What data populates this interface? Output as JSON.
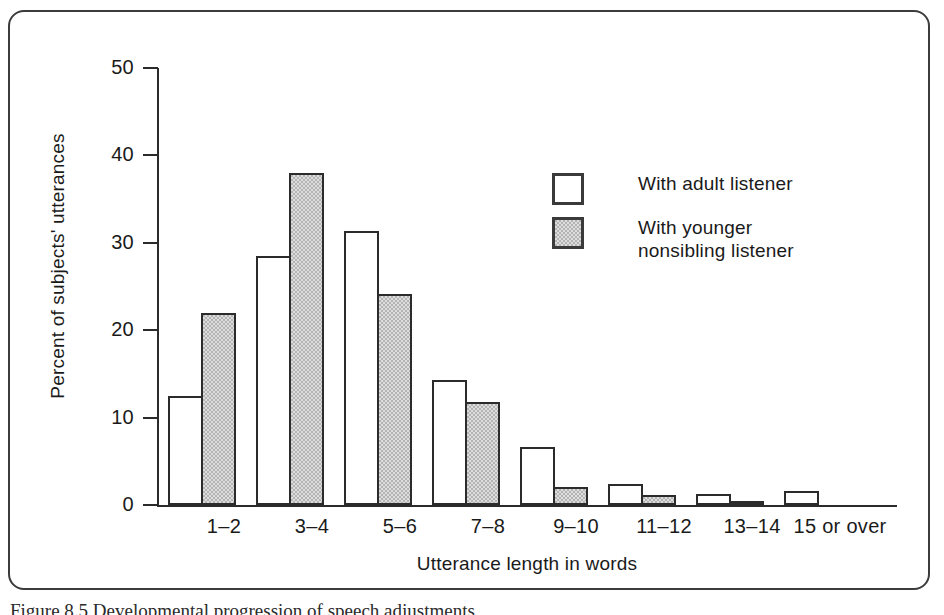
{
  "figure": {
    "caption": "Figure 8.5   Developmental progression of speech adjustments"
  },
  "legend": {
    "position": "inside-top-right",
    "items": [
      {
        "label": "With adult listener",
        "swatch": "white-square-icon",
        "color": "#ffffff"
      },
      {
        "label": "With younger\nnonsibling listener",
        "swatch": "gray-square-icon",
        "color": "#b4b4b4"
      }
    ]
  },
  "chart_data": {
    "type": "bar",
    "title": "",
    "xlabel": "Utterance length in words",
    "ylabel": "Percent of subjects' utterances",
    "categories": [
      "1–2",
      "3–4",
      "5–6",
      "7–8",
      "9–10",
      "11–12",
      "13–14",
      "15 or over"
    ],
    "series": [
      {
        "name": "With adult listener",
        "values": [
          12.5,
          28.5,
          31.3,
          14.3,
          6.6,
          2.4,
          1.3,
          1.6
        ]
      },
      {
        "name": "With younger nonsibling listener",
        "values": [
          22.0,
          38.0,
          24.1,
          11.8,
          2.1,
          1.1,
          0.5,
          0
        ]
      }
    ],
    "ylim": [
      0,
      50
    ],
    "yticks": [
      0,
      10,
      20,
      30,
      40,
      50
    ],
    "ytick_labels": [
      "0",
      "10",
      "20",
      "30",
      "40",
      "50"
    ],
    "grid": false,
    "legend_position": "inside-top-right"
  },
  "colors": {
    "axis": "#2b2b2b",
    "frame": "#3c3c3c",
    "bar_outline": "#2b2b2b",
    "bar_white_fill": "#ffffff",
    "bar_gray_fill": "#b4b4b4",
    "background": "#ffffff"
  }
}
